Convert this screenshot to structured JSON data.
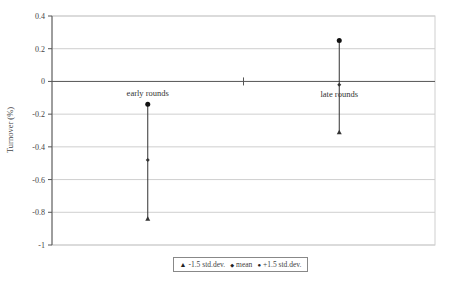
{
  "chart_data": {
    "type": "scatter",
    "subtype": "error-bar",
    "title": "",
    "xlabel": "",
    "ylabel": "Turnover (%)",
    "ylim": [
      -1,
      0.4
    ],
    "yticks": [
      "0.4",
      "0.2",
      "0",
      "-0.2",
      "-0.4",
      "-0.6",
      "-0.8",
      "-1"
    ],
    "grid": true,
    "legend_position": "bottom",
    "categories": [
      "early rounds",
      "late rounds"
    ],
    "series": [
      {
        "name": "-1.5 std.dev.",
        "marker": "triangle",
        "values": [
          -0.84,
          -0.31
        ]
      },
      {
        "name": "mean",
        "marker": "diamond",
        "values": [
          -0.48,
          -0.02
        ]
      },
      {
        "name": "+1.5 std.dev.",
        "marker": "circle",
        "values": [
          -0.14,
          0.25
        ]
      }
    ]
  },
  "legend": {
    "items": [
      {
        "symbol": "▲",
        "label": "-1.5 std.dev."
      },
      {
        "symbol": "◆",
        "label": "mean"
      },
      {
        "symbol": "●",
        "label": "+1.5 std.dev."
      }
    ]
  },
  "colors": {
    "gridline": "#cfcfcf",
    "axis": "#555555",
    "series": "#333333"
  }
}
